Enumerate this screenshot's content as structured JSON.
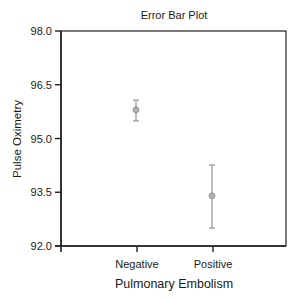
{
  "chart_data": {
    "type": "errorbar",
    "title": "Error Bar Plot",
    "xlabel": "Pulmonary Embolism",
    "ylabel": "Pulse Oximetry",
    "categories": [
      "Negative",
      "Positive"
    ],
    "series": [
      {
        "name": "Pulse Oximetry",
        "values": [
          95.8,
          93.4
        ],
        "upper": [
          96.07,
          94.26
        ],
        "lower": [
          95.49,
          92.5
        ]
      }
    ],
    "ylim": [
      92.0,
      98.0
    ],
    "yticks": [
      "92.0",
      "93.5",
      "95.0",
      "96.5",
      "98.0"
    ],
    "ytick_values": [
      92.0,
      93.5,
      95.0,
      96.5,
      98.0
    ],
    "grid": false,
    "legend": null,
    "colors": {
      "axis": "#222222",
      "errorbar": "#9a9a9a",
      "marker_fill": "#b0b0b0",
      "marker_stroke": "#8a8a8a"
    }
  }
}
